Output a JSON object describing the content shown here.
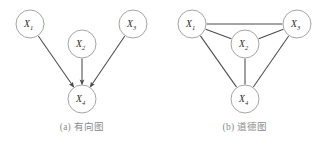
{
  "figure": {
    "width": 327,
    "height": 141,
    "background": "#ffffff",
    "node_stroke": "#9a9a9a",
    "edge_stroke": "#4a4a4a",
    "label_color": "#2b2b2b",
    "caption_color": "#8a8a8a",
    "node_radius": 14
  },
  "panels": [
    {
      "id": "directed-graph",
      "caption": "(a) 有向图",
      "graph_type": "directed",
      "nodes": [
        {
          "id": "X1",
          "label": "X",
          "subscript": "1",
          "cx": 30,
          "cy": 24
        },
        {
          "id": "X2",
          "label": "X",
          "subscript": "2",
          "cx": 82,
          "cy": 44
        },
        {
          "id": "X3",
          "label": "X",
          "subscript": "3",
          "cx": 133,
          "cy": 24
        },
        {
          "id": "X4",
          "label": "X",
          "subscript": "4",
          "cx": 82,
          "cy": 99
        }
      ],
      "edges": [
        {
          "from": "X1",
          "to": "X4",
          "arrow": true
        },
        {
          "from": "X2",
          "to": "X4",
          "arrow": true
        },
        {
          "from": "X3",
          "to": "X4",
          "arrow": true
        }
      ]
    },
    {
      "id": "moral-graph",
      "caption": "(b) 道德图",
      "graph_type": "undirected",
      "nodes": [
        {
          "id": "X1",
          "label": "X",
          "subscript": "1",
          "cx": 29,
          "cy": 24
        },
        {
          "id": "X2",
          "label": "X",
          "subscript": "2",
          "cx": 82,
          "cy": 44
        },
        {
          "id": "X3",
          "label": "X",
          "subscript": "3",
          "cx": 134,
          "cy": 24
        },
        {
          "id": "X4",
          "label": "X",
          "subscript": "4",
          "cx": 82,
          "cy": 99
        }
      ],
      "edges": [
        {
          "from": "X1",
          "to": "X3",
          "arrow": false
        },
        {
          "from": "X1",
          "to": "X2",
          "arrow": false
        },
        {
          "from": "X2",
          "to": "X3",
          "arrow": false
        },
        {
          "from": "X1",
          "to": "X4",
          "arrow": false
        },
        {
          "from": "X2",
          "to": "X4",
          "arrow": false
        },
        {
          "from": "X3",
          "to": "X4",
          "arrow": false
        }
      ]
    }
  ]
}
